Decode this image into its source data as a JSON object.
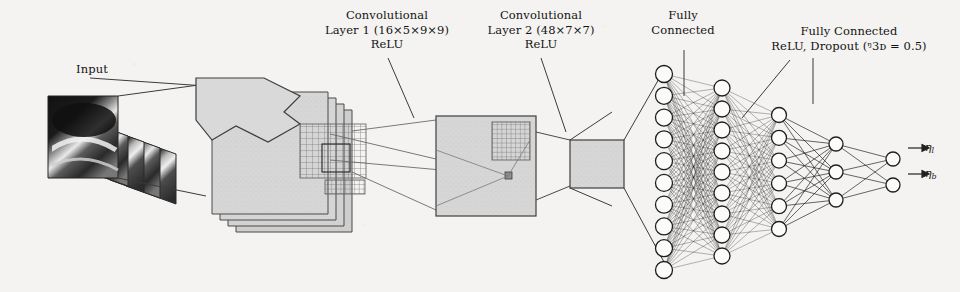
{
  "figure": {
    "type": "neural-network-architecture-diagram",
    "background_color": "#f4f3f1",
    "ink_color": "#1a1a1a"
  },
  "labels": {
    "input": {
      "lines": [
        "Input"
      ]
    },
    "conv1": {
      "lines": [
        "Convolutional",
        "Layer 1 (16×5×9×9)",
        "ReLU"
      ]
    },
    "conv2": {
      "lines": [
        "Convolutional",
        "Layer 2 (48×7×7)",
        "ReLU"
      ]
    },
    "fc1": {
      "lines": [
        "Fully",
        "Connected"
      ]
    },
    "fc2": {
      "lines": [
        "Fully Connected",
        "ReLU, Dropout (ᵑ3ᴅ = 0.5)"
      ]
    }
  },
  "outputs": [
    {
      "name": "output-eta-1",
      "symbol": "η",
      "subscript": "l"
    },
    {
      "name": "output-eta-2",
      "symbol": "η",
      "subscript": "b"
    }
  ],
  "stages": {
    "input_stack": {
      "frames": 5,
      "kind": "grayscale-ultrasound-frames"
    },
    "conv1_maps": {
      "planes": 4,
      "fill": "#d5d5d5"
    },
    "conv2_map": {
      "planes": 1,
      "fill": "#d2d2d2",
      "patch_grid": "7x7"
    },
    "flatten_block": {
      "planes": 1,
      "fill": "#d4d4d4"
    }
  },
  "fc_layers": [
    {
      "name": "fc-column-1",
      "nodes": 10
    },
    {
      "name": "fc-column-2",
      "nodes": 9
    },
    {
      "name": "fc-column-3",
      "nodes": 6
    },
    {
      "name": "fc-column-4",
      "nodes": 3
    },
    {
      "name": "fc-column-5",
      "nodes": 2
    }
  ],
  "chart_data": {
    "type": "diagram",
    "stages": [
      {
        "label": "Input",
        "detail": "stack of 5 grayscale frames"
      },
      {
        "label": "Convolutional Layer 1",
        "detail": "16×5×9×9, ReLU"
      },
      {
        "label": "Convolutional Layer 2",
        "detail": "48×7×7, ReLU"
      },
      {
        "label": "Fully Connected",
        "detail": ""
      },
      {
        "label": "Fully Connected",
        "detail": "ReLU, Dropout (P_D = 0.5)"
      },
      {
        "label": "Output",
        "detail": "2 units: eta_l, eta_b"
      }
    ],
    "fc_node_counts": [
      10,
      9,
      6,
      3,
      2
    ]
  }
}
